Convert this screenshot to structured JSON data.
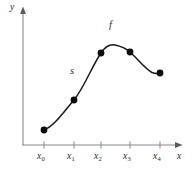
{
  "figure": {
    "background_color": "#ffffff",
    "axis_color": "#8a8a8a",
    "curve_color": "#1a1a1a",
    "point_color": "#0d0d0d",
    "label_color": "#2b2b2b",
    "y_axis_label": "y",
    "x_axis_label": "x",
    "curve_label_f": "f",
    "curve_label_s": "s"
  },
  "ticks": [
    {
      "base": "x",
      "sub": "0",
      "x": 44
    },
    {
      "base": "x",
      "sub": "1",
      "x": 74
    },
    {
      "base": "x",
      "sub": "2",
      "x": 101
    },
    {
      "base": "x",
      "sub": "3",
      "x": 130
    },
    {
      "base": "x",
      "sub": "4",
      "x": 160
    }
  ],
  "chart_data": {
    "type": "line",
    "title": "",
    "xlabel": "x",
    "ylabel": "y",
    "grid": false,
    "legend": "none",
    "annotations": [
      {
        "text": "f",
        "role": "function-curve-label",
        "px": [
          112,
          27
        ]
      },
      {
        "text": "s",
        "role": "spline-curve-label",
        "px": [
          73,
          72
        ]
      }
    ],
    "x_tick_labels": [
      "x₀",
      "x₁",
      "x₂",
      "x₃",
      "x₄"
    ],
    "x": [
      0,
      1,
      2,
      3,
      4
    ],
    "series": [
      {
        "name": "s",
        "kind": "interpolating-spline",
        "markers": true,
        "values_px_y": [
          130,
          100,
          53,
          52,
          73
        ],
        "points_px": [
          [
            44,
            130
          ],
          [
            74,
            100
          ],
          [
            101,
            53
          ],
          [
            130,
            52
          ],
          [
            160,
            73
          ]
        ],
        "normalized_values": [
          0.11,
          0.33,
          0.68,
          0.69,
          0.53
        ]
      }
    ],
    "axis_px": {
      "origin": [
        23,
        145
      ],
      "x_end": [
        180,
        145
      ],
      "y_top": [
        23,
        10
      ]
    },
    "peak_px": [
      115,
      45
    ]
  }
}
